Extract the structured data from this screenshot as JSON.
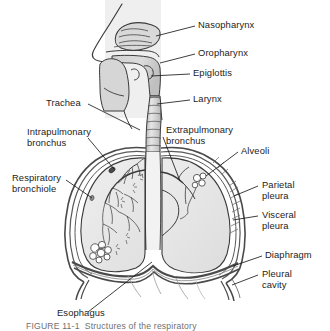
{
  "figure": {
    "type": "anatomical-diagram",
    "caption_partial": "FIGURE 11-1  Structures of the respiratory",
    "background_color": "#ffffff",
    "ink_color": "#1c1c1c",
    "lung_fill": "#e8e8e8",
    "tissue_fill": "#d6d6d6",
    "pleura_fill": "#c9c9c9",
    "band_fill": "#eeeeee"
  },
  "labels": {
    "nasopharynx": "Nasopharynx",
    "oropharynx": "Oropharynx",
    "epiglottis": "Epiglottis",
    "larynx": "Larynx",
    "trachea": "Trachea",
    "intrapulmonary_bronchus": "Intrapulmonary\nbronchus",
    "extrapulmonary_bronchus": "Extrapulmonary\nbronchus",
    "respiratory_bronchiole": "Respiratory\nbronchiole",
    "alveoli": "Alveoli",
    "parietal_pleura": "Parietal\npleura",
    "visceral_pleura": "Visceral\npleura",
    "diaphragm": "Diaphragm",
    "pleural_cavity": "Pleural\ncavity",
    "esophagus": "Esophagus"
  }
}
